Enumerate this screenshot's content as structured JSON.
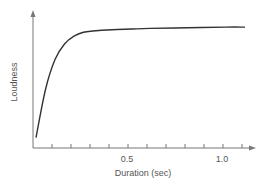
{
  "chart_data": {
    "type": "line",
    "title": "",
    "xlabel": "Duration (sec)",
    "ylabel": "Loudness",
    "x_tick_labels": [
      "0.5",
      "1.0"
    ],
    "x_ticks": [
      0.1,
      0.2,
      0.3,
      0.4,
      0.5,
      0.6,
      0.7,
      0.8,
      0.9,
      1.0,
      1.1
    ],
    "xlim": [
      0,
      1.15
    ],
    "ylim": [
      0,
      1.0
    ],
    "grid": false,
    "legend": null,
    "series": [
      {
        "name": "Loudness vs duration",
        "x": [
          0.0,
          0.05,
          0.1,
          0.15,
          0.2,
          0.25,
          0.3,
          0.4,
          0.5,
          0.6,
          0.8,
          1.0,
          1.1
        ],
        "y": [
          0.08,
          0.45,
          0.68,
          0.8,
          0.86,
          0.89,
          0.9,
          0.91,
          0.915,
          0.92,
          0.925,
          0.93,
          0.93
        ]
      }
    ],
    "annotations": []
  },
  "colors": {
    "axis": "#777777",
    "curve": "#333333",
    "text": "#555555"
  }
}
